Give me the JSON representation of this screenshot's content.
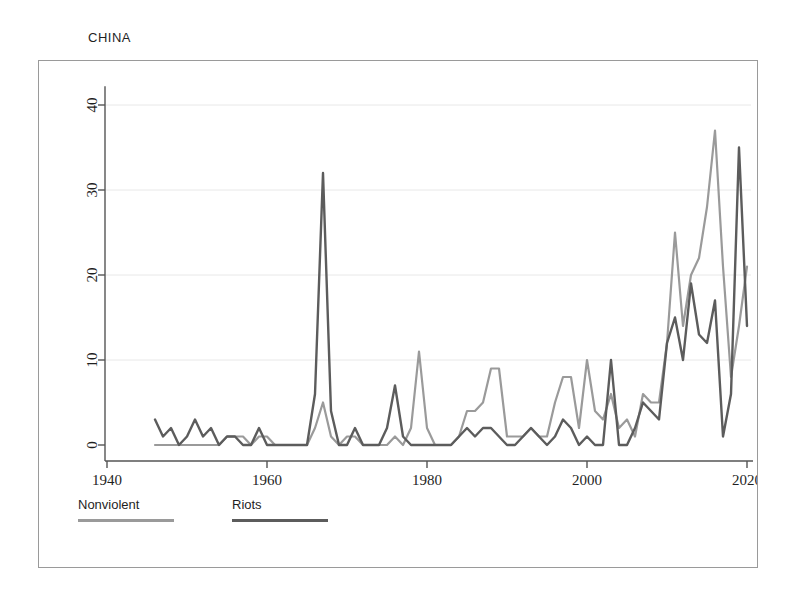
{
  "chart_title": "CHINA",
  "legend": {
    "items": [
      {
        "label": "Nonviolent",
        "color": "#9a9a9a"
      },
      {
        "label": "Riots",
        "color": "#5c5c5c"
      }
    ]
  },
  "axes": {
    "x_ticks": [
      "1940",
      "1960",
      "1980",
      "2000",
      "2020"
    ],
    "y_ticks": [
      "0",
      "10",
      "20",
      "30",
      "40"
    ]
  },
  "chart_data": {
    "type": "line",
    "title": "CHINA",
    "xlabel": "",
    "ylabel": "",
    "xlim": [
      1940,
      2020
    ],
    "ylim": [
      0,
      42
    ],
    "grid": true,
    "legend_position": "below-left",
    "x": [
      1946,
      1947,
      1948,
      1949,
      1950,
      1951,
      1952,
      1953,
      1954,
      1955,
      1956,
      1957,
      1958,
      1959,
      1960,
      1961,
      1962,
      1963,
      1964,
      1965,
      1966,
      1967,
      1968,
      1969,
      1970,
      1971,
      1972,
      1973,
      1974,
      1975,
      1976,
      1977,
      1978,
      1979,
      1980,
      1981,
      1982,
      1983,
      1984,
      1985,
      1986,
      1987,
      1988,
      1989,
      1990,
      1991,
      1992,
      1993,
      1994,
      1995,
      1996,
      1997,
      1998,
      1999,
      2000,
      2001,
      2002,
      2003,
      2004,
      2005,
      2006,
      2007,
      2008,
      2009,
      2010,
      2011,
      2012,
      2013,
      2014,
      2015,
      2016,
      2017,
      2018,
      2019,
      2020
    ],
    "series": [
      {
        "name": "Nonviolent",
        "color": "#9a9a9a",
        "values": [
          0,
          0,
          0,
          0,
          0,
          0,
          0,
          0,
          0,
          1,
          1,
          1,
          0,
          1,
          1,
          0,
          0,
          0,
          0,
          0,
          2,
          5,
          1,
          0,
          1,
          1,
          0,
          0,
          0,
          0,
          1,
          0,
          2,
          11,
          2,
          0,
          0,
          0,
          1,
          4,
          4,
          5,
          9,
          9,
          1,
          1,
          1,
          2,
          1,
          1,
          5,
          8,
          8,
          2,
          10,
          4,
          3,
          6,
          2,
          3,
          1,
          6,
          5,
          5,
          12,
          25,
          14,
          20,
          22,
          28,
          37,
          21,
          8,
          14,
          21
        ]
      },
      {
        "name": "Riots",
        "color": "#5c5c5c",
        "values": [
          3,
          1,
          2,
          0,
          1,
          3,
          1,
          2,
          0,
          1,
          1,
          0,
          0,
          2,
          0,
          0,
          0,
          0,
          0,
          0,
          6,
          32,
          4,
          0,
          0,
          2,
          0,
          0,
          0,
          2,
          7,
          1,
          0,
          0,
          0,
          0,
          0,
          0,
          1,
          2,
          1,
          2,
          2,
          1,
          0,
          0,
          1,
          2,
          1,
          0,
          1,
          3,
          2,
          0,
          1,
          0,
          0,
          10,
          0,
          0,
          2,
          5,
          4,
          3,
          12,
          15,
          10,
          19,
          13,
          12,
          17,
          1,
          6,
          35,
          14
        ]
      }
    ],
    "annotations": [
      {
        "text": "peak riots 1967",
        "x": 1967,
        "y": 32
      },
      {
        "text": "peak nonviolent 2016",
        "x": 2016,
        "y": 37
      },
      {
        "text": "peak riots 2019",
        "x": 2019,
        "y": 35
      }
    ]
  }
}
